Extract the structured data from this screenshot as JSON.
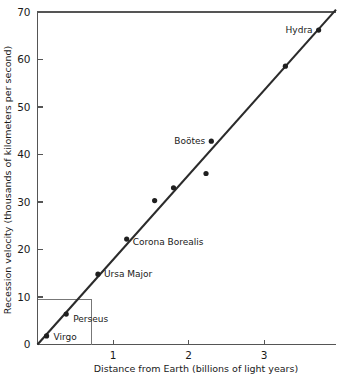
{
  "chart_data": {
    "type": "scatter",
    "title": "",
    "xlabel": "Distance from Earth (billions of light years)",
    "ylabel": "Recession velocity (thousands of kilometers per second)",
    "xlim": [
      0,
      3.95
    ],
    "ylim": [
      0,
      70
    ],
    "xticks": [
      1,
      2,
      3
    ],
    "xtick_labels": [
      "1",
      "2",
      "3"
    ],
    "yticks": [
      0,
      10,
      20,
      30,
      40,
      50,
      60,
      70
    ],
    "ytick_labels": [
      "0",
      "10",
      "20",
      "30",
      "40",
      "50",
      "60",
      "70"
    ],
    "grid": false,
    "legend": "none",
    "points": [
      {
        "name": "Virgo",
        "x": 0.12,
        "y": 1.8,
        "label": "Virgo",
        "label_dx": 7,
        "label_dy": 4,
        "anchor": "start"
      },
      {
        "name": "Perseus",
        "x": 0.38,
        "y": 6.4,
        "label": "Perseus",
        "label_dx": 7,
        "label_dy": 8,
        "anchor": "start"
      },
      {
        "name": "Ursa Major",
        "x": 0.8,
        "y": 14.8,
        "label": "Ursa Major",
        "label_dx": 6,
        "label_dy": 3,
        "anchor": "start"
      },
      {
        "name": "Corona Borealis",
        "x": 1.18,
        "y": 22.2,
        "label": "Corona Borealis",
        "label_dx": 6,
        "label_dy": 6,
        "anchor": "start"
      },
      {
        "name": "point-5",
        "x": 1.55,
        "y": 30.3,
        "label": "",
        "label_dx": 0,
        "label_dy": 0,
        "anchor": "start"
      },
      {
        "name": "point-6",
        "x": 1.8,
        "y": 33.0,
        "label": "",
        "label_dx": 0,
        "label_dy": 0,
        "anchor": "start"
      },
      {
        "name": "Bootes",
        "x": 2.3,
        "y": 42.8,
        "label": "Boötes",
        "label_dx": -6,
        "label_dy": 3,
        "anchor": "end"
      },
      {
        "name": "point-8",
        "x": 2.23,
        "y": 36.0,
        "label": "",
        "label_dx": 0,
        "label_dy": 0,
        "anchor": "start"
      },
      {
        "name": "point-9",
        "x": 3.28,
        "y": 58.6,
        "label": "",
        "label_dx": 0,
        "label_dy": 0,
        "anchor": "start"
      },
      {
        "name": "Hydra",
        "x": 3.72,
        "y": 66.2,
        "label": "Hydra",
        "label_dx": -6,
        "label_dy": 3,
        "anchor": "end"
      }
    ],
    "fit_line": {
      "x0": 0,
      "y0": 0,
      "x1": 3.95,
      "y1": 70.5
    },
    "construction": {
      "x": 0.72,
      "y": 9.5
    },
    "colors": {
      "axis": "#555555",
      "point": "#1f1f1f",
      "fit_line": "#2b2b2b",
      "construction": "#777777",
      "background": "#ffffff",
      "text": "#1a1a1a"
    }
  }
}
